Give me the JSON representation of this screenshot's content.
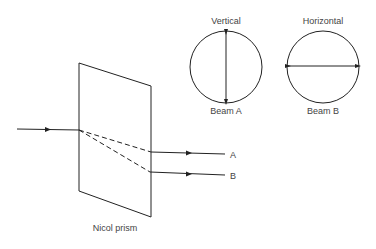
{
  "diagram": {
    "prism_label": "Nicol prism",
    "beams": [
      {
        "id": "A",
        "label": "A",
        "polarization": "Vertical",
        "caption": "Beam A"
      },
      {
        "id": "B",
        "label": "B",
        "polarization": "Horizontal",
        "caption": "Beam B"
      }
    ]
  }
}
